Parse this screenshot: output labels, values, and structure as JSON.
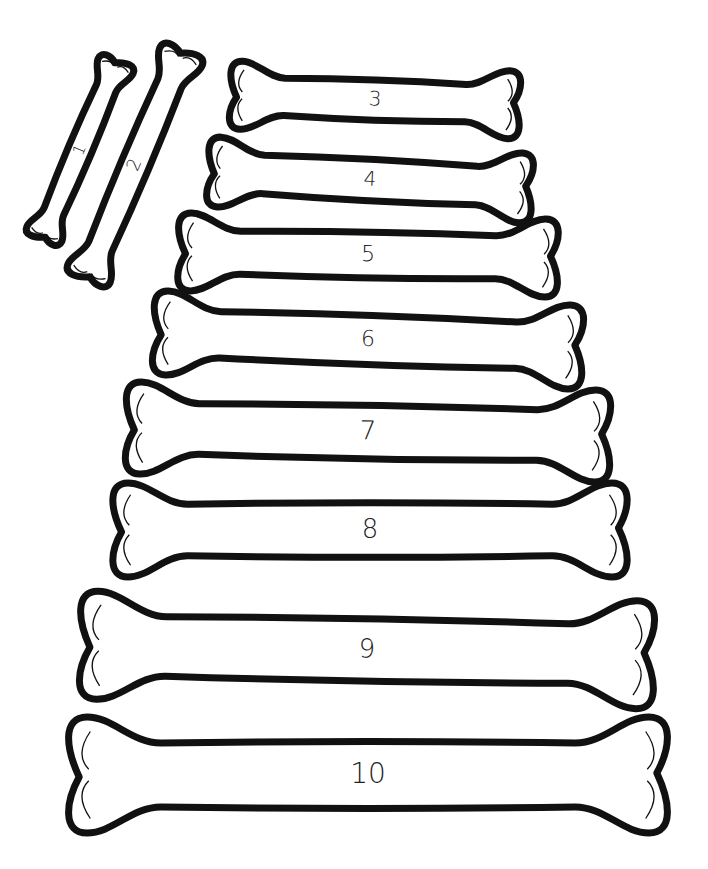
{
  "page": {
    "type": "coloring-page"
  },
  "bones": [
    {
      "label": "1",
      "cx": 80,
      "cy": 150,
      "length": 195,
      "width": 38,
      "angle": -67,
      "font": 16
    },
    {
      "label": "2",
      "cx": 135,
      "cy": 165,
      "length": 250,
      "width": 46,
      "angle": -67,
      "font": 18
    },
    {
      "label": "3",
      "cx": 375,
      "cy": 100,
      "length": 290,
      "width": 68,
      "angle": 2,
      "font": 20
    },
    {
      "label": "4",
      "cx": 370,
      "cy": 180,
      "length": 325,
      "width": 70,
      "angle": 3,
      "font": 20
    },
    {
      "label": "5",
      "cx": 368,
      "cy": 255,
      "length": 380,
      "width": 78,
      "angle": 1,
      "font": 22
    },
    {
      "label": "6",
      "cx": 368,
      "cy": 340,
      "length": 430,
      "width": 84,
      "angle": 2,
      "font": 22
    },
    {
      "label": "7",
      "cx": 368,
      "cy": 432,
      "length": 485,
      "width": 92,
      "angle": 1,
      "font": 26
    },
    {
      "label": "8",
      "cx": 370,
      "cy": 530,
      "length": 515,
      "width": 94,
      "angle": 0,
      "font": 26
    },
    {
      "label": "9",
      "cx": 367,
      "cy": 650,
      "length": 575,
      "width": 108,
      "angle": 1,
      "font": 26
    },
    {
      "label": "10",
      "cx": 368,
      "cy": 775,
      "length": 600,
      "width": 116,
      "angle": 0,
      "font": 28
    }
  ],
  "colors": {
    "outline": "#111111",
    "fill": "#ffffff",
    "background": "#ffffff"
  }
}
